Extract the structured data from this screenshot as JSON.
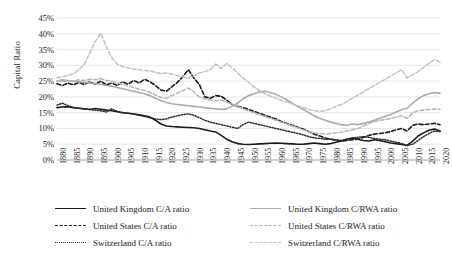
{
  "chart_data": {
    "type": "line",
    "title": "",
    "xlabel": "",
    "ylabel": "Capital Ratio",
    "xlim": [
      1880,
      2020
    ],
    "ylim": [
      0,
      45
    ],
    "ytick_step": 5,
    "ytick_labels": [
      "45%",
      "40%",
      "35%",
      "30%",
      "25%",
      "20%",
      "15%",
      "10%",
      "5%",
      "0%"
    ],
    "ytick_values": [
      45,
      40,
      35,
      30,
      25,
      20,
      15,
      10,
      5,
      0
    ],
    "xtick_labels": [
      "1880",
      "1885",
      "1890",
      "1895",
      "1900",
      "1905",
      "1910",
      "1915",
      "1920",
      "1925",
      "1930",
      "1935",
      "1940",
      "1945",
      "1950",
      "1955",
      "1960",
      "1965",
      "1970",
      "1975",
      "1980",
      "1985",
      "1990",
      "1995",
      "2000",
      "2005",
      "2010",
      "2015",
      "2020"
    ],
    "xtick_values": [
      1880,
      1885,
      1890,
      1895,
      1900,
      1905,
      1910,
      1915,
      1920,
      1925,
      1930,
      1935,
      1940,
      1945,
      1950,
      1955,
      1960,
      1965,
      1970,
      1975,
      1980,
      1985,
      1990,
      1995,
      2000,
      2005,
      2010,
      2015,
      2020
    ],
    "grid": "horizontal",
    "legend_position": "bottom",
    "series": [
      {
        "name": "United Kingdom C/A ratio",
        "color": "#1a1a1a",
        "style": "solid",
        "width": 1.6,
        "x": [
          1880,
          1882,
          1884,
          1886,
          1888,
          1890,
          1892,
          1894,
          1896,
          1898,
          1900,
          1902,
          1904,
          1906,
          1908,
          1910,
          1912,
          1914,
          1916,
          1918,
          1920,
          1922,
          1924,
          1926,
          1928,
          1930,
          1932,
          1934,
          1936,
          1938,
          1940,
          1942,
          1944,
          1946,
          1948,
          1950,
          1952,
          1954,
          1956,
          1958,
          1960,
          1962,
          1964,
          1966,
          1968,
          1970,
          1972,
          1974,
          1976,
          1978,
          1980,
          1982,
          1984,
          1986,
          1988,
          1990,
          1992,
          1994,
          1996,
          1998,
          2000,
          2002,
          2004,
          2006,
          2008,
          2010,
          2012,
          2014,
          2016,
          2018,
          2020
        ],
        "y": [
          16.6,
          16.8,
          16.9,
          16.6,
          16.4,
          16.2,
          16.0,
          16.3,
          16.1,
          15.8,
          15.6,
          15.3,
          15.0,
          14.8,
          14.6,
          14.3,
          14.0,
          13.6,
          12.6,
          11.4,
          10.8,
          10.6,
          10.5,
          10.4,
          10.3,
          10.2,
          10.0,
          9.6,
          9.2,
          8.9,
          7.8,
          6.6,
          5.8,
          5.2,
          5.0,
          4.9,
          5.0,
          5.1,
          5.2,
          5.3,
          5.4,
          5.3,
          5.2,
          5.1,
          5.0,
          5.0,
          5.2,
          5.4,
          5.2,
          5.0,
          5.2,
          5.6,
          6.0,
          6.6,
          7.0,
          6.6,
          6.2,
          6.0,
          6.4,
          6.2,
          5.8,
          5.4,
          5.2,
          4.9,
          4.6,
          6.0,
          7.6,
          8.6,
          9.4,
          9.8,
          9.2
        ]
      },
      {
        "name": "United States C/A ratio",
        "color": "#1a1a1a",
        "style": "dashed",
        "width": 1.6,
        "x": [
          1880,
          1882,
          1884,
          1886,
          1888,
          1890,
          1892,
          1894,
          1896,
          1898,
          1900,
          1902,
          1904,
          1906,
          1908,
          1910,
          1912,
          1914,
          1916,
          1918,
          1920,
          1922,
          1924,
          1926,
          1928,
          1930,
          1932,
          1934,
          1936,
          1938,
          1940,
          1942,
          1944,
          1946,
          1948,
          1950,
          1952,
          1954,
          1956,
          1958,
          1960,
          1962,
          1964,
          1966,
          1968,
          1970,
          1972,
          1974,
          1976,
          1978,
          1980,
          1982,
          1984,
          1986,
          1988,
          1990,
          1992,
          1994,
          1996,
          1998,
          2000,
          2002,
          2004,
          2006,
          2008,
          2010,
          2012,
          2014,
          2016,
          2018,
          2020
        ],
        "y": [
          24.2,
          23.6,
          24.4,
          23.8,
          24.6,
          23.9,
          24.8,
          24.0,
          25.0,
          23.8,
          24.4,
          23.6,
          24.8,
          24.0,
          25.2,
          24.4,
          25.6,
          24.8,
          23.6,
          22.2,
          21.8,
          23.2,
          24.6,
          26.4,
          28.6,
          26.0,
          24.0,
          20.0,
          19.6,
          20.4,
          20.2,
          19.0,
          17.6,
          17.0,
          16.6,
          16.0,
          15.4,
          14.8,
          14.2,
          13.6,
          13.0,
          12.2,
          11.6,
          11.0,
          10.4,
          9.8,
          9.0,
          8.2,
          7.6,
          7.0,
          6.6,
          6.2,
          6.0,
          6.2,
          6.4,
          6.6,
          7.2,
          7.8,
          8.2,
          8.4,
          8.6,
          9.0,
          9.6,
          10.0,
          9.2,
          11.0,
          11.4,
          11.2,
          11.4,
          11.6,
          11.2
        ]
      },
      {
        "name": "Switzerland C/A ratio",
        "color": "#2a2a2a",
        "style": "dotted",
        "width": 1.5,
        "x": [
          1880,
          1882,
          1884,
          1886,
          1888,
          1890,
          1892,
          1894,
          1896,
          1898,
          1900,
          1902,
          1904,
          1906,
          1908,
          1910,
          1912,
          1914,
          1916,
          1918,
          1920,
          1922,
          1924,
          1926,
          1928,
          1930,
          1932,
          1934,
          1936,
          1938,
          1940,
          1942,
          1944,
          1946,
          1948,
          1950,
          1952,
          1954,
          1956,
          1958,
          1960,
          1962,
          1964,
          1966,
          1968,
          1970,
          1972,
          1974,
          1976,
          1978,
          1980,
          1982,
          1984,
          1986,
          1988,
          1990,
          1992,
          1994,
          1996,
          1998,
          2000,
          2002,
          2004,
          2006,
          2008,
          2010,
          2012,
          2014,
          2016,
          2018,
          2020
        ],
        "y": [
          17.4,
          18.0,
          17.2,
          16.6,
          16.4,
          16.2,
          16.0,
          15.8,
          15.6,
          15.2,
          16.2,
          15.4,
          15.0,
          14.8,
          14.6,
          14.2,
          13.8,
          13.4,
          13.0,
          12.8,
          13.0,
          13.6,
          14.0,
          14.4,
          14.6,
          14.2,
          13.4,
          12.6,
          12.0,
          11.6,
          11.2,
          10.8,
          10.4,
          10.0,
          11.2,
          12.0,
          11.6,
          11.2,
          10.8,
          10.4,
          10.0,
          9.6,
          9.2,
          8.8,
          8.4,
          8.0,
          7.4,
          7.0,
          6.8,
          6.6,
          6.6,
          6.4,
          6.2,
          6.6,
          7.0,
          7.2,
          7.4,
          7.2,
          6.8,
          6.6,
          6.4,
          6.0,
          5.6,
          5.2,
          4.6,
          5.0,
          6.2,
          7.4,
          8.4,
          9.2,
          9.0
        ]
      },
      {
        "name": "United Kingdom C/RWA ratio",
        "color": "#aaaaaa",
        "style": "solid",
        "width": 1.6,
        "x": [
          1880,
          1882,
          1884,
          1886,
          1888,
          1890,
          1892,
          1894,
          1896,
          1898,
          1900,
          1902,
          1904,
          1906,
          1908,
          1910,
          1912,
          1914,
          1916,
          1918,
          1920,
          1922,
          1924,
          1926,
          1928,
          1930,
          1932,
          1934,
          1936,
          1938,
          1940,
          1942,
          1944,
          1946,
          1948,
          1950,
          1952,
          1954,
          1956,
          1958,
          1960,
          1962,
          1964,
          1966,
          1968,
          1970,
          1972,
          1974,
          1976,
          1978,
          1980,
          1982,
          1984,
          1986,
          1988,
          1990,
          1992,
          1994,
          1996,
          1998,
          2000,
          2002,
          2004,
          2006,
          2008,
          2010,
          2012,
          2014,
          2016,
          2018,
          2020
        ],
        "y": [
          25.0,
          25.4,
          25.2,
          25.0,
          24.8,
          24.6,
          24.4,
          24.2,
          24.0,
          23.6,
          23.4,
          23.0,
          22.6,
          22.2,
          21.8,
          21.4,
          21.0,
          20.4,
          19.6,
          18.8,
          18.2,
          17.8,
          17.6,
          17.4,
          17.2,
          17.0,
          16.8,
          16.6,
          16.4,
          16.2,
          16.0,
          16.2,
          17.0,
          18.0,
          19.4,
          20.4,
          21.0,
          21.6,
          21.8,
          21.4,
          20.8,
          20.0,
          19.0,
          18.0,
          17.0,
          16.0,
          15.0,
          14.0,
          13.2,
          12.6,
          12.0,
          11.6,
          11.2,
          11.0,
          11.4,
          11.2,
          11.6,
          12.0,
          12.6,
          13.2,
          13.8,
          14.4,
          15.2,
          16.0,
          16.4,
          18.0,
          19.4,
          20.4,
          21.0,
          21.4,
          21.2
        ]
      },
      {
        "name": "United States C/RWA ratio",
        "color": "#b4b4b4",
        "style": "dashed",
        "width": 1.5,
        "x": [
          1880,
          1882,
          1884,
          1886,
          1888,
          1890,
          1892,
          1894,
          1896,
          1898,
          1900,
          1902,
          1904,
          1906,
          1908,
          1910,
          1912,
          1914,
          1916,
          1918,
          1920,
          1922,
          1924,
          1926,
          1928,
          1930,
          1932,
          1934,
          1936,
          1938,
          1940,
          1942,
          1944,
          1946,
          1948,
          1950,
          1952,
          1954,
          1956,
          1958,
          1960,
          1962,
          1964,
          1966,
          1968,
          1970,
          1972,
          1974,
          1976,
          1978,
          1980,
          1982,
          1984,
          1986,
          1988,
          1990,
          1992,
          1994,
          1996,
          1998,
          2000,
          2002,
          2004,
          2006,
          2008,
          2010,
          2012,
          2014,
          2016,
          2018,
          2020
        ],
        "y": [
          25.0,
          24.8,
          25.2,
          25.0,
          25.4,
          25.2,
          25.6,
          25.4,
          25.8,
          25.2,
          25.0,
          24.4,
          24.0,
          23.4,
          23.0,
          22.4,
          22.0,
          21.4,
          20.6,
          19.8,
          19.6,
          20.4,
          21.2,
          22.0,
          22.8,
          21.6,
          20.0,
          19.4,
          19.0,
          18.8,
          19.0,
          18.4,
          17.6,
          17.0,
          16.2,
          15.6,
          15.0,
          14.4,
          13.8,
          13.2,
          12.6,
          12.0,
          11.4,
          10.8,
          10.2,
          9.6,
          9.0,
          8.6,
          8.4,
          8.2,
          8.4,
          8.6,
          8.8,
          9.2,
          9.6,
          10.0,
          10.8,
          11.6,
          12.2,
          12.6,
          12.8,
          13.2,
          13.6,
          14.0,
          13.2,
          15.0,
          15.6,
          15.8,
          16.0,
          16.2,
          16.0
        ]
      },
      {
        "name": "Switzerland C/RWA ratio",
        "color": "#c0c0c0",
        "style": "dashed",
        "width": 1.5,
        "x": [
          1880,
          1882,
          1884,
          1886,
          1888,
          1890,
          1892,
          1894,
          1896,
          1898,
          1900,
          1902,
          1904,
          1906,
          1908,
          1910,
          1912,
          1914,
          1916,
          1918,
          1920,
          1922,
          1924,
          1926,
          1928,
          1930,
          1932,
          1934,
          1936,
          1938,
          1940,
          1942,
          1944,
          1946,
          1948,
          1950,
          1952,
          1954,
          1956,
          1958,
          1960,
          1962,
          1964,
          1966,
          1968,
          1970,
          1972,
          1974,
          1976,
          1978,
          1980,
          1982,
          1984,
          1986,
          1988,
          1990,
          1992,
          1994,
          1996,
          1998,
          2000,
          2002,
          2004,
          2006,
          2008,
          2010,
          2012,
          2014,
          2016,
          2018,
          2020
        ],
        "y": [
          26.0,
          26.4,
          26.8,
          27.4,
          28.6,
          30.4,
          34.0,
          37.6,
          40.2,
          36.0,
          32.4,
          30.4,
          29.6,
          29.2,
          28.8,
          28.6,
          28.4,
          28.2,
          27.8,
          27.4,
          27.6,
          27.2,
          26.8,
          26.4,
          26.0,
          26.6,
          27.6,
          28.0,
          28.6,
          30.4,
          29.0,
          30.6,
          29.2,
          27.6,
          26.0,
          24.6,
          23.2,
          22.0,
          21.0,
          20.2,
          19.6,
          19.0,
          18.4,
          17.8,
          17.2,
          16.6,
          16.0,
          15.6,
          15.4,
          15.6,
          16.2,
          17.0,
          17.6,
          18.6,
          19.6,
          20.6,
          21.6,
          22.6,
          23.6,
          24.6,
          25.6,
          26.6,
          27.6,
          28.6,
          26.0,
          27.0,
          28.0,
          29.4,
          30.6,
          31.8,
          31.0
        ]
      }
    ]
  },
  "legend": {
    "items": [
      {
        "label": "United Kingdom C/A ratio"
      },
      {
        "label": "United States C/A ratio"
      },
      {
        "label": "Switzerland C/A ratio"
      },
      {
        "label": "United Kingdom C/RWA ratio"
      },
      {
        "label": "United States C/RWA ratio"
      },
      {
        "label": "Switzerland C/RWA ratio"
      }
    ]
  }
}
